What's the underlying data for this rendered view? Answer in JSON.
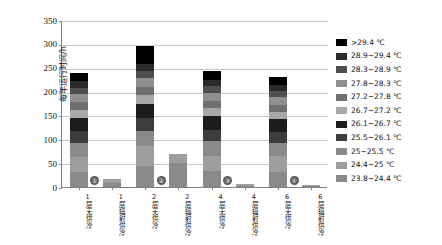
{
  "chart_data": {
    "type": "bar",
    "stacked": true,
    "title": "",
    "xlabel": "",
    "ylabel": "每年运行时间/h",
    "ylim": [
      0,
      350
    ],
    "yticks": [
      0,
      50,
      100,
      150,
      200,
      250,
      300,
      350
    ],
    "grid": true,
    "legend_position": "right",
    "categories": [
      "1层\n无供冷",
      "1层\n辐射供冷",
      "2层\n无供冷",
      "2层\n辐射供冷",
      "4层\n无供冷",
      "4层\n辐射供冷",
      "6层\n无供冷",
      "6层\n辐射供冷"
    ],
    "series": [
      {
        "name": ">29.4 ℃",
        "color": "#000000",
        "values": [
          18,
          0,
          38,
          0,
          20,
          0,
          17,
          0
        ]
      },
      {
        "name": "28.9~29.4 ℃",
        "color": "#2b2b2b",
        "values": [
          14,
          0,
          14,
          0,
          13,
          0,
          12,
          0
        ]
      },
      {
        "name": "28.3~28.9 ℃",
        "color": "#4f4f4f",
        "values": [
          14,
          0,
          15,
          0,
          14,
          0,
          13,
          0
        ]
      },
      {
        "name": "27.8~28.3 ℃",
        "color": "#8f8f8f",
        "values": [
          16,
          0,
          18,
          0,
          16,
          0,
          15,
          0
        ]
      },
      {
        "name": "27.2~27.8 ℃",
        "color": "#707070",
        "values": [
          16,
          0,
          17,
          0,
          16,
          0,
          15,
          0
        ]
      },
      {
        "name": "26.7~27.2 ℃",
        "color": "#a8a8a8",
        "values": [
          17,
          0,
          19,
          0,
          17,
          0,
          16,
          0
        ]
      },
      {
        "name": "26.1~26.7 ℃",
        "color": "#1c1c1c",
        "values": [
          28,
          0,
          30,
          0,
          28,
          0,
          26,
          0
        ]
      },
      {
        "name": "25.5~26.1 ℃",
        "color": "#3d3d3d",
        "values": [
          24,
          0,
          26,
          0,
          24,
          0,
          23,
          0
        ]
      },
      {
        "name": "25~25.5 ℃",
        "color": "#8a8a8a",
        "values": [
          30,
          0,
          33,
          0,
          30,
          0,
          29,
          0
        ]
      },
      {
        "name": "24.4~25 ℃",
        "color": "#9e9e9e",
        "values": [
          32,
          8,
          40,
          20,
          33,
          3,
          32,
          2
        ]
      },
      {
        "name": "23.8~24.4 ℃",
        "color": "#8a8a8a",
        "values": [
          31,
          8,
          45,
          50,
          33,
          3,
          32,
          3
        ]
      }
    ],
    "totals": [
      240,
      16,
      295,
      70,
      244,
      6,
      230,
      5
    ],
    "annotations": [
      {
        "label": "①",
        "category": "1层\n无供冷"
      },
      {
        "label": "②",
        "category": "2层\n无供冷"
      },
      {
        "label": "③",
        "category": "4层\n无供冷"
      },
      {
        "label": "④",
        "category": "6层\n无供冷"
      }
    ]
  }
}
